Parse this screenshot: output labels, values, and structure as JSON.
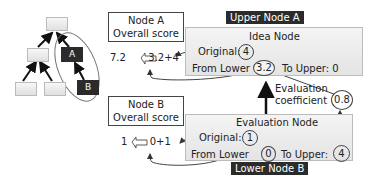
{
  "tree": {
    "node_a_label": "A",
    "node_b_label": "B"
  },
  "upper": {
    "score_title_line1": "Node A",
    "score_title_line2": "Overall score",
    "score_result": "7.2",
    "score_formula": "3.2+4",
    "tag": "Upper Node A",
    "panel_title": "Idea Node",
    "original_label": "Original:",
    "original_value": "4",
    "from_lower_label": "From Lower",
    "from_lower_value": "3.2",
    "to_upper_label": "To Upper: 0"
  },
  "coefficient": {
    "label_line1": "Evaluation",
    "label_line2": "coefficient",
    "value": "0.8",
    "multiply_symbol": "X"
  },
  "lower": {
    "score_title_line1": "Node B",
    "score_title_line2": "Overall score",
    "score_result": "1",
    "score_formula": "0+1",
    "tag": "Lower Node B",
    "panel_title": "Evaluation Node",
    "original_label": "Original:",
    "original_value": "1",
    "from_lower_label": "From Lower",
    "from_lower_value": "0",
    "to_upper_label": "To Upper:",
    "to_upper_value": "4"
  },
  "colors": {
    "dark": "#2b2b2b",
    "panel": "#ececec",
    "border": "#444444"
  }
}
